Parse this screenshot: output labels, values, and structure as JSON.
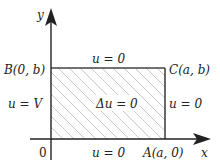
{
  "diagram": {
    "axes": {
      "x_label": "x",
      "y_label": "y",
      "origin_label": "0"
    },
    "corners": {
      "B": "B(0, b)",
      "C": "C(a, b)",
      "A": "A(a, 0)"
    },
    "boundary_conditions": {
      "top": "u = 0",
      "left": "u = V",
      "right": "u = 0",
      "bottom": "u = 0"
    },
    "interior_equation": "Δu = 0",
    "colors": {
      "line": "#222222",
      "hatch": "#c8c8c8"
    }
  }
}
